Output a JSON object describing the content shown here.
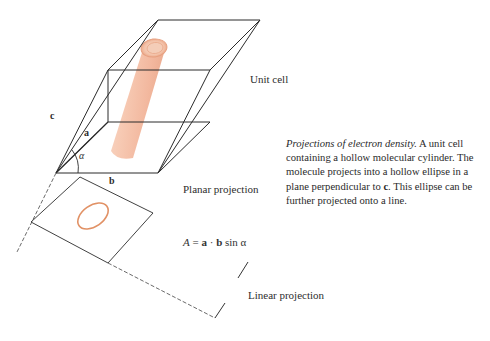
{
  "figure": {
    "labels": {
      "unit_cell": "Unit cell",
      "planar_projection": "Planar projection",
      "linear_projection": "Linear projection",
      "vector_c": "c",
      "vector_a": "a",
      "vector_b": "b",
      "angle_alpha": "α"
    },
    "formula": {
      "area_symbol": "A",
      "equals": " = ",
      "vec_a": "a",
      "dot": " · ",
      "vec_b": "b",
      "sin": " sin ",
      "alpha": "α"
    },
    "caption": {
      "title": "Projections of electron density.",
      "part1": " A unit cell containing a hollow molecular cylinder. The molecule projects into a hollow ellipse in a plane perpendicular to ",
      "vec_c": "c",
      "part2": ". This ellipse can be further projected onto a line."
    },
    "colors": {
      "line": "#2b2b2b",
      "cylinder": "#f0b59a",
      "cylinder_edge": "#e39a7a",
      "ellipse": "#d9753f"
    }
  }
}
